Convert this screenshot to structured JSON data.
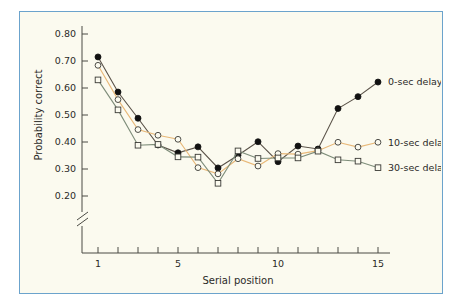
{
  "figure": {
    "background_color": "#fbfaef",
    "border_color": "#6ba3cc"
  },
  "chart_data": {
    "type": "line",
    "title": "",
    "xlabel": "Serial position",
    "ylabel": "Probability correct",
    "xlim": [
      1,
      15
    ],
    "ylim": [
      0.2,
      0.8
    ],
    "xticks": [
      1,
      2,
      3,
      4,
      5,
      6,
      7,
      8,
      9,
      10,
      11,
      12,
      13,
      14,
      15
    ],
    "xtick_labels": [
      "1",
      "",
      "",
      "",
      "5",
      "",
      "",
      "",
      "",
      "10",
      "",
      "",
      "",
      "",
      "15"
    ],
    "yticks": [
      0.2,
      0.3,
      0.4,
      0.5,
      0.6,
      0.7,
      0.8
    ],
    "ytick_labels": [
      "0.20",
      "0.30",
      "0.40",
      "0.50",
      "0.60",
      "0.70",
      "0.80"
    ],
    "grid": false,
    "axis_break": true,
    "axis_break_note": "y-axis broken below 0.20",
    "legend_position": "right-inline",
    "x": [
      1,
      2,
      3,
      4,
      5,
      6,
      7,
      8,
      9,
      10,
      11,
      12,
      13,
      14,
      15
    ],
    "series": [
      {
        "name": "0-sec delay",
        "label": "0-sec delay",
        "color": "#5a5248",
        "marker": "filled-circle",
        "marker_fill": "#111111",
        "values": [
          0.715,
          0.585,
          0.488,
          0.389,
          0.36,
          0.382,
          0.304,
          0.351,
          0.401,
          0.327,
          0.385,
          0.374,
          0.524,
          0.568,
          0.622
        ]
      },
      {
        "name": "10-sec delay",
        "label": "10-sec delay",
        "color": "#e8b878",
        "marker": "open-circle",
        "marker_fill": "#fbfaef",
        "values": [
          0.684,
          0.557,
          0.446,
          0.425,
          0.41,
          0.305,
          0.282,
          0.338,
          0.311,
          0.357,
          0.355,
          0.368,
          0.399,
          0.381,
          0.399
        ]
      },
      {
        "name": "30-sec delay",
        "label": "30-sec delay",
        "color": "#7e8d7a",
        "marker": "open-square",
        "marker_fill": "#fbfaef",
        "values": [
          0.63,
          0.519,
          0.388,
          0.391,
          0.345,
          0.344,
          0.247,
          0.367,
          0.339,
          0.341,
          0.341,
          0.366,
          0.334,
          0.329,
          0.305
        ]
      }
    ]
  }
}
